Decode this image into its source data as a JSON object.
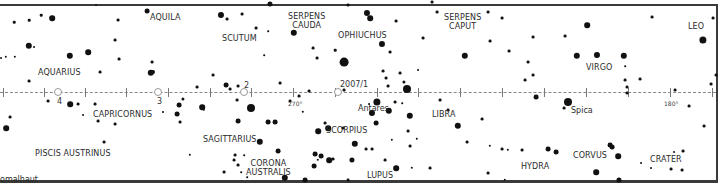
{
  "map": {
    "title": "Ecliptic star chart (Aquarius to Leo)",
    "frame_color": "#3a3a3a",
    "constellations": [
      {
        "name": "AQUILA",
        "x": 150,
        "y": 13
      },
      {
        "name": "SCUTUM",
        "x": 222,
        "y": 34
      },
      {
        "name": "SERPENS",
        "line2": "CAUDA",
        "x": 288,
        "y": 12
      },
      {
        "name": "OPHIUCHUS",
        "x": 338,
        "y": 31
      },
      {
        "name": "SERPENS",
        "line2": "CAPUT",
        "x": 444,
        "y": 13
      },
      {
        "name": "LEO",
        "x": 688,
        "y": 22
      },
      {
        "name": "AQUARIUS",
        "x": 38,
        "y": 68
      },
      {
        "name": "VIRGO",
        "x": 586,
        "y": 63
      },
      {
        "name": "CAPRICORNUS",
        "x": 93,
        "y": 110
      },
      {
        "name": "SAGITTARIUS",
        "x": 203,
        "y": 135
      },
      {
        "name": "SCORPIUS",
        "x": 326,
        "y": 126
      },
      {
        "name": "LIBRA",
        "x": 432,
        "y": 110
      },
      {
        "name": "PISCIS AUSTRINUS",
        "x": 35,
        "y": 149
      },
      {
        "name": "CORONA",
        "line2": "AUSTRALIS",
        "x": 246,
        "y": 159
      },
      {
        "name": "HYDRA",
        "x": 521,
        "y": 162
      },
      {
        "name": "CORVUS",
        "x": 573,
        "y": 151
      },
      {
        "name": "CRATER",
        "x": 650,
        "y": 155
      },
      {
        "name": "LUPUS",
        "x": 367,
        "y": 171
      }
    ],
    "star_names": [
      {
        "name": "Antares",
        "x": 358,
        "y": 104
      },
      {
        "name": "Spica",
        "x": 571,
        "y": 106
      },
      {
        "name": "Fomalhaut",
        "display": "omalhaut",
        "x": 0,
        "y": 175
      }
    ],
    "ecliptic": {
      "degree_labels": [
        {
          "label": "270°",
          "x": 288,
          "y": 100
        },
        {
          "label": "180°",
          "x": 664,
          "y": 100
        }
      ],
      "tick_x": [
        3,
        44,
        85,
        126,
        168,
        210,
        251,
        293,
        335,
        377,
        418,
        460,
        502,
        544,
        586,
        628,
        670,
        712
      ],
      "planet_positions": [
        {
          "label": "4",
          "x": 58,
          "label_x": 57,
          "label_y": 97
        },
        {
          "label": "3",
          "x": 158,
          "label_x": 157,
          "label_y": 97
        },
        {
          "label": "2",
          "x": 244,
          "label_x": 244,
          "label_y": 81
        },
        {
          "label": "2007/1",
          "x": 338,
          "label_x": 340,
          "label_y": 80
        }
      ]
    },
    "stars": [
      [
        14,
        22,
        1.6
      ],
      [
        29,
        20,
        1.6
      ],
      [
        41,
        15,
        1.6
      ],
      [
        52,
        18,
        3.5
      ],
      [
        88,
        52,
        3.5
      ],
      [
        6,
        57,
        1.5
      ],
      [
        1,
        58,
        1.2
      ],
      [
        15,
        57,
        1.5
      ],
      [
        34,
        47,
        1.2
      ],
      [
        29,
        46,
        4
      ],
      [
        70,
        56,
        4
      ],
      [
        100,
        72,
        1.8
      ],
      [
        29,
        81,
        1.8
      ],
      [
        118,
        20,
        1.8
      ],
      [
        115,
        40,
        1.8
      ],
      [
        119,
        59,
        1.8
      ],
      [
        152,
        62,
        1.8
      ],
      [
        153,
        72,
        2.5
      ],
      [
        151,
        73,
        4
      ],
      [
        147,
        11,
        3
      ],
      [
        96,
        5,
        1.2
      ],
      [
        221,
        15,
        3.8
      ],
      [
        227,
        19,
        1.8
      ],
      [
        242,
        14,
        1.8
      ],
      [
        256,
        28,
        1.8
      ],
      [
        268,
        31,
        1
      ],
      [
        264,
        55,
        1
      ],
      [
        213,
        75,
        1.8
      ],
      [
        226,
        85,
        3
      ],
      [
        230,
        89,
        1.8
      ],
      [
        238,
        86,
        1.8
      ],
      [
        280,
        83,
        1.8
      ],
      [
        270,
        4,
        3.2
      ],
      [
        294,
        33,
        4
      ],
      [
        313,
        48,
        1.8
      ],
      [
        317,
        58,
        1.8
      ],
      [
        335,
        50,
        1.6
      ],
      [
        344,
        62,
        5.5
      ],
      [
        348,
        5,
        1.8
      ],
      [
        382,
        44,
        3.8
      ],
      [
        367,
        13,
        3.8
      ],
      [
        370,
        18,
        3.5
      ],
      [
        390,
        52,
        1.8
      ],
      [
        396,
        21,
        1.8
      ],
      [
        418,
        70,
        1.2
      ],
      [
        383,
        71,
        1.8
      ],
      [
        386,
        78,
        1.8
      ],
      [
        388,
        86,
        1.8
      ],
      [
        400,
        73,
        1.8
      ],
      [
        407,
        89,
        5
      ],
      [
        404,
        82,
        2
      ],
      [
        432,
        2,
        1.8
      ],
      [
        437,
        12,
        1.8
      ],
      [
        423,
        38,
        1.8
      ],
      [
        465,
        56,
        4
      ],
      [
        488,
        12,
        1.8
      ],
      [
        490,
        41,
        1.8
      ],
      [
        502,
        18,
        1.8
      ],
      [
        509,
        51,
        1.8
      ],
      [
        528,
        62,
        1.8
      ],
      [
        533,
        37,
        1.8
      ],
      [
        525,
        80,
        1.8
      ],
      [
        533,
        75,
        1.8
      ],
      [
        565,
        36,
        1.8
      ],
      [
        577,
        56,
        4
      ],
      [
        587,
        25,
        3.5
      ],
      [
        597,
        55,
        3.8
      ],
      [
        625,
        80,
        1.8
      ],
      [
        627,
        87,
        1.8
      ],
      [
        624,
        56,
        4
      ],
      [
        625,
        66,
        1
      ],
      [
        640,
        79,
        1.8
      ],
      [
        652,
        17,
        1.8
      ],
      [
        703,
        40,
        4.5
      ],
      [
        713,
        18,
        1.8
      ],
      [
        716,
        75,
        1.8
      ],
      [
        711,
        84,
        1.8
      ],
      [
        183,
        99,
        2
      ],
      [
        179,
        105,
        3
      ],
      [
        163,
        112,
        1.2
      ],
      [
        177,
        114,
        3
      ],
      [
        178,
        113,
        1.2
      ],
      [
        197,
        87,
        1.8
      ],
      [
        95,
        104,
        1.8
      ],
      [
        98,
        121,
        1.8
      ],
      [
        115,
        124,
        1.8
      ],
      [
        104,
        142,
        1.8
      ],
      [
        10,
        117,
        1.8
      ],
      [
        6,
        128,
        3.5
      ],
      [
        48,
        101,
        1.8
      ],
      [
        70,
        104,
        3.5
      ],
      [
        78,
        104,
        1.8
      ],
      [
        83,
        115,
        1.2
      ],
      [
        180,
        122,
        1.8
      ],
      [
        202,
        107,
        3.5
      ],
      [
        204,
        110,
        1.5
      ],
      [
        251,
        108,
        5
      ],
      [
        251,
        110,
        1
      ],
      [
        238,
        121,
        3
      ],
      [
        237,
        100,
        1.8
      ],
      [
        268,
        122,
        3
      ],
      [
        290,
        101,
        1.8
      ],
      [
        275,
        122,
        3
      ],
      [
        303,
        112,
        1.5
      ],
      [
        325,
        123,
        1.8
      ],
      [
        328,
        128,
        3.5
      ],
      [
        318,
        131,
        3.5
      ],
      [
        343,
        128,
        1.8
      ],
      [
        299,
        96,
        1.8
      ],
      [
        309,
        91,
        1.8
      ],
      [
        344,
        90,
        1.8
      ],
      [
        260,
        142,
        4
      ],
      [
        278,
        151,
        3
      ],
      [
        190,
        155,
        1.5
      ],
      [
        235,
        155,
        1.8
      ],
      [
        234,
        160,
        1.8
      ],
      [
        244,
        155,
        1
      ],
      [
        238,
        165,
        1.8
      ],
      [
        241,
        172,
        1
      ],
      [
        224,
        172,
        1.8
      ],
      [
        247,
        177,
        1
      ],
      [
        315,
        154,
        3
      ],
      [
        321,
        156,
        3
      ],
      [
        329,
        160,
        3.5
      ],
      [
        314,
        166,
        3
      ],
      [
        333,
        159,
        1.8
      ],
      [
        318,
        160,
        1.5
      ],
      [
        285,
        178,
        4
      ],
      [
        305,
        180,
        3
      ],
      [
        348,
        180,
        1.8
      ],
      [
        395,
        102,
        1.8
      ],
      [
        389,
        111,
        4
      ],
      [
        387,
        110,
        1
      ],
      [
        377,
        102,
        4.5
      ],
      [
        372,
        113,
        3.8
      ],
      [
        369,
        104,
        1.2
      ],
      [
        402,
        103,
        1
      ],
      [
        410,
        116,
        4
      ],
      [
        408,
        131,
        1.8
      ],
      [
        410,
        146,
        1.8
      ],
      [
        392,
        140,
        1.5
      ],
      [
        417,
        139,
        1.5
      ],
      [
        376,
        123,
        3
      ],
      [
        355,
        144,
        4
      ],
      [
        366,
        149,
        1.8
      ],
      [
        372,
        149,
        1.8
      ],
      [
        352,
        160,
        3.2
      ],
      [
        385,
        160,
        1.8
      ],
      [
        396,
        168,
        3.5
      ],
      [
        430,
        168,
        1.8
      ],
      [
        412,
        168,
        1.5
      ],
      [
        458,
        126,
        4
      ],
      [
        448,
        110,
        1.8
      ],
      [
        440,
        100,
        1.8
      ],
      [
        467,
        142,
        1.8
      ],
      [
        490,
        146,
        1.5
      ],
      [
        502,
        149,
        1.8
      ],
      [
        522,
        150,
        1.8
      ],
      [
        482,
        119,
        1.8
      ],
      [
        508,
        150,
        1.5
      ],
      [
        488,
        173,
        1.8
      ],
      [
        505,
        180,
        1.5
      ],
      [
        536,
        97,
        3
      ],
      [
        568,
        102,
        5
      ],
      [
        548,
        149,
        3
      ],
      [
        556,
        152,
        3
      ],
      [
        610,
        145,
        3
      ],
      [
        612,
        147,
        3
      ],
      [
        618,
        156,
        3.5
      ],
      [
        596,
        172,
        3.5
      ],
      [
        619,
        180,
        3.2
      ],
      [
        641,
        163,
        1.2
      ],
      [
        651,
        168,
        1.2
      ],
      [
        671,
        169,
        1.8
      ],
      [
        674,
        152,
        1.2
      ],
      [
        683,
        151,
        1.8
      ],
      [
        682,
        170,
        1.8
      ],
      [
        689,
        106,
        1.8
      ],
      [
        704,
        126,
        1.8
      ],
      [
        675,
        90,
        1.8
      ],
      [
        627,
        93,
        1.8
      ],
      [
        564,
        108,
        1.8
      ]
    ]
  }
}
